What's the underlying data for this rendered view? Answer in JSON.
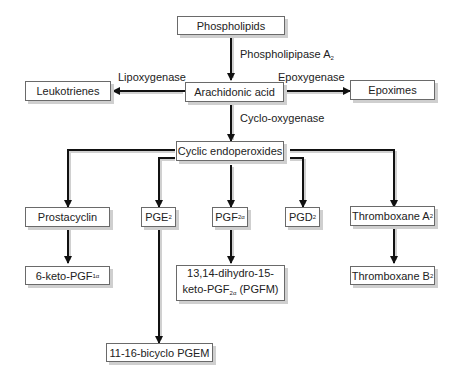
{
  "diagram": {
    "nodes": {
      "phospholipids": "Phospholipids",
      "arachidonic_acid": "Arachidonic acid",
      "leukotrienes": "Leukotrienes",
      "epoximes": "Epoximes",
      "cyclic_endoperoxides": "Cyclic endoperoxides",
      "prostacyclin": "Prostacyclin",
      "pge2": {
        "main": "PGE",
        "sub": "2"
      },
      "pgf2a": {
        "main": "PGF",
        "sub": "2α"
      },
      "pgd2": {
        "main": "PGD",
        "sub": "2"
      },
      "thromboxane_a2": {
        "main": "Thromboxane A",
        "sub": "2"
      },
      "keto_pgf1a": {
        "main": "6-keto-PGF",
        "sub": "1α"
      },
      "pgfm": {
        "line1": "13,14-dihydro-15-",
        "line2_main": "keto-PGF",
        "line2_sub": "2α",
        "line2_tail": " (PGFM)"
      },
      "thromboxane_b2": {
        "main": "Thromboxane B",
        "sub": "2"
      },
      "bicyclo_pgem": "11-16-bicyclo PGEM"
    },
    "enzymes": {
      "phospholipase": {
        "main": "Phospholipipase A",
        "sub": "2"
      },
      "lipoxygenase": "Lipoxygenase",
      "epoxygenase": "Epoxygenase",
      "cyclooxygenase": "Cyclo-oxygenase"
    },
    "edges": [
      {
        "from": "Phospholipids",
        "to": "Arachidonic acid",
        "label": "Phospholipipase A2"
      },
      {
        "from": "Arachidonic acid",
        "to": "Leukotrienes",
        "label": "Lipoxygenase"
      },
      {
        "from": "Arachidonic acid",
        "to": "Epoximes",
        "label": "Epoxygenase"
      },
      {
        "from": "Arachidonic acid",
        "to": "Cyclic endoperoxides",
        "label": "Cyclo-oxygenase"
      },
      {
        "from": "Cyclic endoperoxides",
        "to": "Prostacyclin"
      },
      {
        "from": "Cyclic endoperoxides",
        "to": "PGE2"
      },
      {
        "from": "Cyclic endoperoxides",
        "to": "PGF2α"
      },
      {
        "from": "Cyclic endoperoxides",
        "to": "PGD2"
      },
      {
        "from": "Cyclic endoperoxides",
        "to": "Thromboxane A2"
      },
      {
        "from": "Prostacyclin",
        "to": "6-keto-PGF1α"
      },
      {
        "from": "PGE2",
        "to": "11-16-bicyclo PGEM"
      },
      {
        "from": "PGF2α",
        "to": "13,14-dihydro-15-keto-PGF2α (PGFM)"
      },
      {
        "from": "Thromboxane A2",
        "to": "Thromboxane B2"
      }
    ]
  }
}
